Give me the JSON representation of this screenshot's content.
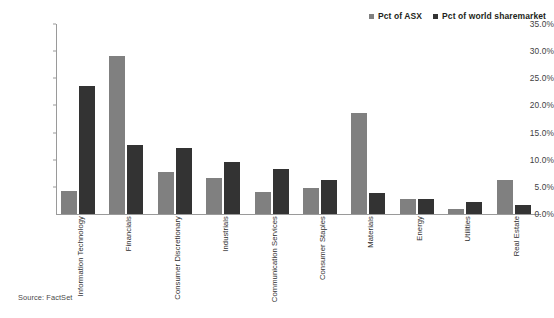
{
  "chart_data": {
    "type": "bar",
    "title": "",
    "subtitle": "",
    "xlabel": "",
    "ylabel": "",
    "ylim": [
      0,
      35
    ],
    "ytick_step": 5,
    "ytick_labels": [
      "0.0%",
      "5.0%",
      "10.0%",
      "15.0%",
      "20.0%",
      "25.0%",
      "30.0%",
      "35.0%"
    ],
    "ytick_values": [
      0,
      5,
      10,
      15,
      20,
      25,
      30,
      35
    ],
    "grid": false,
    "legend_position": "top-right",
    "value_suffix": "%",
    "categories": [
      "Information Technology",
      "Financials",
      "Consumer Discretionary",
      "Industrials",
      "Communication Services",
      "Consumer Staples",
      "Materials",
      "Energy",
      "Utilities",
      "Real Estate"
    ],
    "series": [
      {
        "name": "Pct of ASX",
        "color": "#808080",
        "values": [
          4.3,
          29.2,
          7.7,
          6.7,
          4.1,
          4.8,
          18.7,
          2.8,
          1.0,
          6.2
        ]
      },
      {
        "name": "Pct of world sharemarket",
        "color": "#333333",
        "values": [
          23.6,
          12.8,
          12.1,
          9.5,
          8.3,
          6.2,
          3.9,
          2.8,
          2.2,
          1.6
        ]
      }
    ],
    "source": "Source: FactSet"
  },
  "legend": {
    "items": [
      {
        "label": "Pct of ASX",
        "color": "#808080"
      },
      {
        "label": "Pct of world sharemarket",
        "color": "#333333"
      }
    ]
  },
  "footer": {
    "source": "Source: FactSet"
  },
  "colors": {
    "axis": "#9a9a9a",
    "text": "#3a3a3a",
    "background": "#ffffff",
    "series_asx": "#808080",
    "series_world": "#333333"
  }
}
